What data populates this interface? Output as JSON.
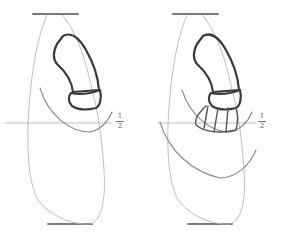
{
  "figure": {
    "panels": [
      {
        "id": "left",
        "label": "stage 1"
      },
      {
        "id": "right",
        "label": "stage 2"
      }
    ],
    "half_mark": {
      "numerator": "1",
      "denominator": "2"
    },
    "colors": {
      "pencil_dark": "#3a3a3a",
      "pencil_light": "#b8b8b8",
      "paper": "#ffffff"
    }
  }
}
